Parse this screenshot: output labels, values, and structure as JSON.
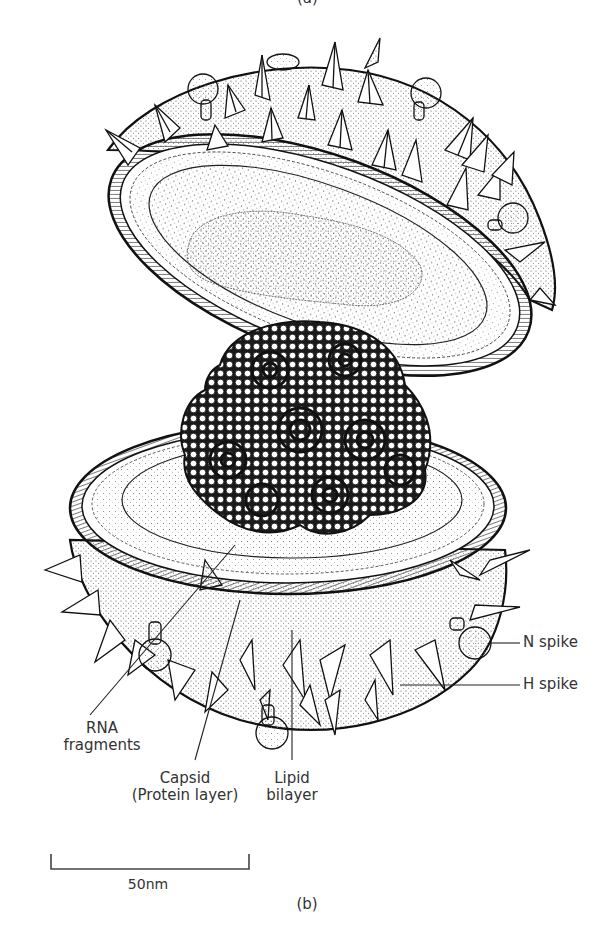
{
  "figure": {
    "panel_top_label": "(a)",
    "panel_label": "(b)",
    "colors": {
      "ink": "#1a1a1a",
      "stipple": "#555555",
      "background": "#ffffff",
      "label_text": "#333333"
    }
  },
  "labels": {
    "n_spike": "N spike",
    "h_spike": "H spike",
    "rna_line1": "RNA",
    "rna_line2": "fragments",
    "capsid_line1": "Capsid",
    "capsid_line2": "(Protein layer)",
    "lipid_line1": "Lipid",
    "lipid_line2": "bilayer"
  },
  "scale_bar": {
    "value": "50",
    "unit": "nm",
    "label": "50nm"
  }
}
